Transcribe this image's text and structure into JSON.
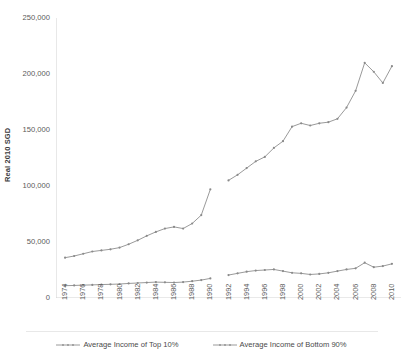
{
  "chart_data": {
    "type": "line",
    "title": "",
    "xlabel": "",
    "ylabel": "Real 2010 SGD",
    "ylim": [
      0,
      250000
    ],
    "xlim": [
      1973,
      2011
    ],
    "grid": false,
    "legend_position": "bottom",
    "y_ticks": [
      0,
      50000,
      100000,
      150000,
      200000,
      250000
    ],
    "y_tick_labels": [
      "0",
      "50,000",
      "100,000",
      "150,000",
      "200,000",
      "250,000"
    ],
    "x_ticks": [
      1974,
      1976,
      1978,
      1980,
      1982,
      1984,
      1986,
      1988,
      1990,
      1992,
      1994,
      1996,
      1998,
      2000,
      2002,
      2004,
      2006,
      2008,
      2010
    ],
    "x_tick_labels": [
      "1974",
      "1976",
      "1978",
      "1980",
      "1982",
      "1984",
      "1986",
      "1988",
      "1990",
      "1992",
      "1994",
      "1996",
      "1998",
      "2000",
      "2002",
      "2004",
      "2006",
      "2008",
      "2010"
    ],
    "note": "Both series are broken between 1990 and 1992 (no data for 1991).",
    "series": [
      {
        "name": "Average Income of Top 10%",
        "color": "#9a9a9a",
        "x": [
          1974,
          1975,
          1976,
          1977,
          1978,
          1979,
          1980,
          1981,
          1982,
          1983,
          1984,
          1985,
          1986,
          1987,
          1988,
          1989,
          1990,
          1992,
          1993,
          1994,
          1995,
          1996,
          1997,
          1998,
          1999,
          2000,
          2001,
          2002,
          2003,
          2004,
          2005,
          2006,
          2007,
          2008,
          2009,
          2010
        ],
        "values": [
          36000,
          37500,
          39500,
          41500,
          42500,
          43500,
          45000,
          48000,
          51500,
          55500,
          59000,
          62000,
          63500,
          62000,
          66500,
          74000,
          97000,
          105000,
          110000,
          116000,
          122000,
          126000,
          134000,
          140000,
          153000,
          156000,
          154000,
          156000,
          157000,
          160000,
          170000,
          185000,
          210000,
          202000,
          192000,
          207000
        ]
      },
      {
        "name": "Average Income of Bottom 90%",
        "color": "#9a9a9a",
        "x": [
          1974,
          1975,
          1976,
          1977,
          1978,
          1979,
          1980,
          1981,
          1982,
          1983,
          1984,
          1985,
          1986,
          1987,
          1988,
          1989,
          1990,
          1992,
          1993,
          1994,
          1995,
          1996,
          1997,
          1998,
          1999,
          2000,
          2001,
          2002,
          2003,
          2004,
          2005,
          2006,
          2007,
          2008,
          2009,
          2010
        ],
        "values": [
          11000,
          11200,
          11500,
          11700,
          12000,
          12200,
          12500,
          13000,
          13400,
          13800,
          14200,
          14000,
          13800,
          14200,
          15000,
          16000,
          17500,
          20500,
          22000,
          23500,
          24500,
          25000,
          25500,
          24000,
          22500,
          22000,
          21000,
          21500,
          22500,
          24000,
          25500,
          26500,
          31500,
          27500,
          28500,
          30500
        ]
      }
    ]
  },
  "legend": {
    "entries": [
      {
        "label": "Average Income of Top 10%"
      },
      {
        "label": "Average Income of Bottom 90%"
      }
    ]
  }
}
